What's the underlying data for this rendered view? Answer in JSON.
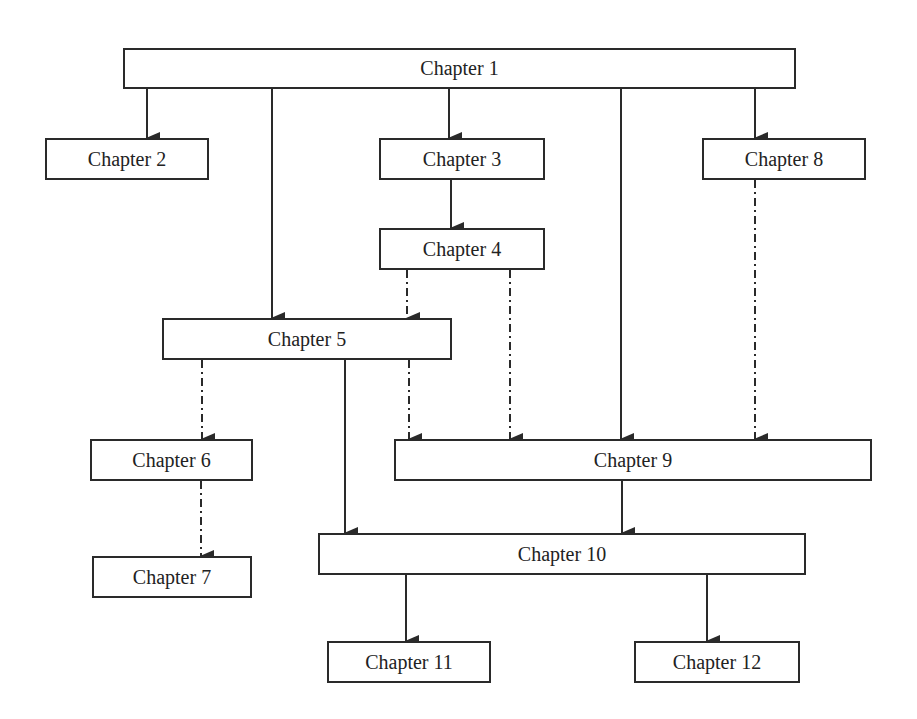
{
  "diagram": {
    "legend": {
      "solid": "required prerequisite",
      "dash_dot": "optional / recommended"
    },
    "nodes": [
      {
        "id": "ch1",
        "label": "Chapter 1",
        "x": 123,
        "y": 48,
        "w": 673,
        "h": 41
      },
      {
        "id": "ch2",
        "label": "Chapter 2",
        "x": 45,
        "y": 138,
        "w": 164,
        "h": 42
      },
      {
        "id": "ch3",
        "label": "Chapter 3",
        "x": 379,
        "y": 138,
        "w": 166,
        "h": 42
      },
      {
        "id": "ch8",
        "label": "Chapter 8",
        "x": 702,
        "y": 138,
        "w": 164,
        "h": 42
      },
      {
        "id": "ch4",
        "label": "Chapter 4",
        "x": 379,
        "y": 228,
        "w": 166,
        "h": 42
      },
      {
        "id": "ch5",
        "label": "Chapter 5",
        "x": 162,
        "y": 318,
        "w": 290,
        "h": 42
      },
      {
        "id": "ch6",
        "label": "Chapter 6",
        "x": 90,
        "y": 439,
        "w": 163,
        "h": 42
      },
      {
        "id": "ch9",
        "label": "Chapter 9",
        "x": 394,
        "y": 439,
        "w": 478,
        "h": 42
      },
      {
        "id": "ch7",
        "label": "Chapter 7",
        "x": 92,
        "y": 556,
        "w": 160,
        "h": 42
      },
      {
        "id": "ch10",
        "label": "Chapter 10",
        "x": 318,
        "y": 533,
        "w": 488,
        "h": 42
      },
      {
        "id": "ch11",
        "label": "Chapter 11",
        "x": 327,
        "y": 641,
        "w": 164,
        "h": 42
      },
      {
        "id": "ch12",
        "label": "Chapter 12",
        "x": 634,
        "y": 641,
        "w": 166,
        "h": 42
      }
    ],
    "edges": [
      {
        "from": "ch1",
        "to": "ch2",
        "style": "solid",
        "x1": 147,
        "y1": 89,
        "x2": 147,
        "y2": 138
      },
      {
        "from": "ch1",
        "to": "ch5",
        "style": "solid",
        "x1": 272,
        "y1": 89,
        "x2": 272,
        "y2": 318
      },
      {
        "from": "ch1",
        "to": "ch3",
        "style": "solid",
        "x1": 449,
        "y1": 89,
        "x2": 449,
        "y2": 138
      },
      {
        "from": "ch1",
        "to": "ch9",
        "style": "solid",
        "x1": 621,
        "y1": 89,
        "x2": 621,
        "y2": 439
      },
      {
        "from": "ch1",
        "to": "ch8",
        "style": "solid",
        "x1": 755,
        "y1": 89,
        "x2": 755,
        "y2": 138
      },
      {
        "from": "ch3",
        "to": "ch4",
        "style": "solid",
        "x1": 451,
        "y1": 180,
        "x2": 451,
        "y2": 228
      },
      {
        "from": "ch4",
        "to": "ch5",
        "style": "dash_dot",
        "x1": 407,
        "y1": 270,
        "x2": 407,
        "y2": 318
      },
      {
        "from": "ch4",
        "to": "ch9",
        "style": "dash_dot",
        "x1": 510,
        "y1": 270,
        "x2": 510,
        "y2": 439
      },
      {
        "from": "ch8",
        "to": "ch9",
        "style": "dash_dot",
        "x1": 755,
        "y1": 180,
        "x2": 755,
        "y2": 439
      },
      {
        "from": "ch5",
        "to": "ch6",
        "style": "dash_dot",
        "x1": 202,
        "y1": 360,
        "x2": 202,
        "y2": 439
      },
      {
        "from": "ch5",
        "to": "ch9",
        "style": "dash_dot",
        "x1": 409,
        "y1": 360,
        "x2": 409,
        "y2": 439
      },
      {
        "from": "ch5",
        "to": "ch10",
        "style": "solid",
        "x1": 345,
        "y1": 360,
        "x2": 345,
        "y2": 533
      },
      {
        "from": "ch6",
        "to": "ch7",
        "style": "dash_dot",
        "x1": 201,
        "y1": 481,
        "x2": 201,
        "y2": 556
      },
      {
        "from": "ch9",
        "to": "ch10",
        "style": "solid",
        "x1": 622,
        "y1": 481,
        "x2": 622,
        "y2": 533
      },
      {
        "from": "ch10",
        "to": "ch11",
        "style": "solid",
        "x1": 406,
        "y1": 575,
        "x2": 406,
        "y2": 641
      },
      {
        "from": "ch10",
        "to": "ch12",
        "style": "solid",
        "x1": 707,
        "y1": 575,
        "x2": 707,
        "y2": 641
      }
    ]
  },
  "colors": {
    "line": "#2a2a2a",
    "background": "#ffffff",
    "text": "#222222"
  }
}
